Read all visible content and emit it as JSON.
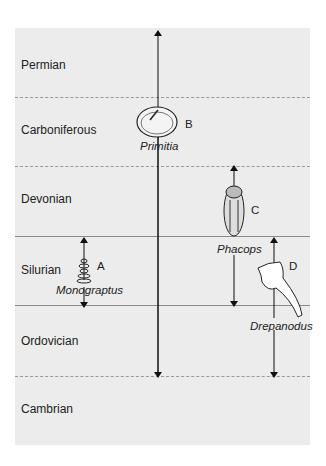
{
  "periods": [
    {
      "name": "Permian",
      "y": 58
    },
    {
      "name": "Carboniferous",
      "y": 123
    },
    {
      "name": "Devonian",
      "y": 192
    },
    {
      "name": "Silurian",
      "y": 263
    },
    {
      "name": "Ordovician",
      "y": 334
    },
    {
      "name": "Cambrian",
      "y": 402
    }
  ],
  "fossils": {
    "A": {
      "letter": "A",
      "name": "Monograptus"
    },
    "B": {
      "letter": "B",
      "name": "Primitia"
    },
    "C": {
      "letter": "C",
      "name": "Phacops"
    },
    "D": {
      "letter": "D",
      "name": "Drepanodus"
    }
  }
}
